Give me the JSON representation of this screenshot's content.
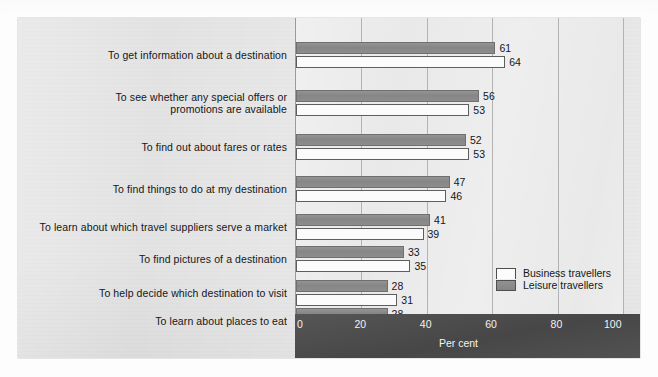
{
  "chart_data": {
    "type": "bar",
    "orientation": "horizontal",
    "title": "",
    "subtitle": "",
    "xlabel": "Per cent",
    "ylabel": "",
    "xlim": [
      0,
      100
    ],
    "xticks": [
      "0",
      "20",
      "40",
      "60",
      "80",
      "100"
    ],
    "xtick_values": [
      0,
      20,
      40,
      60,
      80,
      100
    ],
    "grid": true,
    "legend_position": "inside-bottom-right",
    "categories": [
      "To get information about a destination",
      "To see whether any special offers or promotions are available",
      "To find out about fares or rates",
      "To find things to do at my destination",
      "To learn about which travel suppliers serve a market",
      "To find pictures of a destination",
      "To help decide which destination to visit",
      "To learn about places to eat"
    ],
    "category_lines": [
      [
        "To get information about a destination"
      ],
      [
        "To see whether any special offers or",
        "promotions are available"
      ],
      [
        "To find out about fares or rates"
      ],
      [
        "To find things to do at my destination"
      ],
      [
        "To learn about which travel suppliers serve a market"
      ],
      [
        "To find pictures of a destination"
      ],
      [
        "To help decide which destination to visit"
      ],
      [
        "To learn about places to eat"
      ]
    ],
    "series": [
      {
        "name": "Leisure travellers",
        "color": "#8a8a8a",
        "values": [
          61,
          56,
          52,
          47,
          41,
          33,
          28,
          28
        ],
        "labels": [
          "61",
          "56",
          "52",
          "47",
          "41",
          "33",
          "28",
          "28"
        ]
      },
      {
        "name": "Business travellers",
        "color": "#fbfbfb",
        "values": [
          64,
          53,
          53,
          46,
          39,
          35,
          31,
          33
        ],
        "labels": [
          "64",
          "53",
          "53",
          "46",
          "39",
          "35",
          "31",
          "33"
        ]
      }
    ]
  },
  "legend": {
    "items": [
      {
        "label": "Business travellers",
        "swatch": "business"
      },
      {
        "label": "Leisure travellers",
        "swatch": "leisure"
      }
    ]
  },
  "axis": {
    "unit_label": "Per cent"
  },
  "colors": {
    "panel_background": "#e3e3e3",
    "plot_background": "#e8e8e8",
    "axis_band": "#4b4b4b",
    "leisure_bar": "#8a8a8a",
    "business_bar": "#fbfbfb",
    "gridline": "#b3b3b3",
    "text": "#15161a",
    "axis_text": "#f2f2f2"
  }
}
